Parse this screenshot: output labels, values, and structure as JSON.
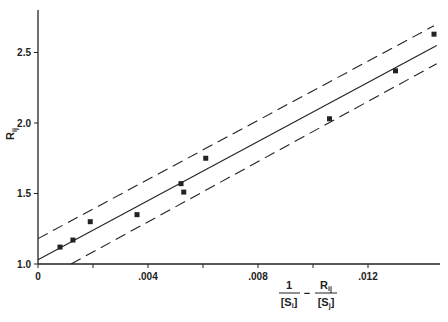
{
  "chart_data": {
    "type": "scatter",
    "title": "",
    "xlabel": "1/[S_i] - R_ij/[S_j]",
    "ylabel": "R_ij",
    "xlim": [
      0,
      0.0145
    ],
    "ylim": [
      1.0,
      2.8
    ],
    "grid": false,
    "legend": null,
    "x_ticks": [
      0,
      0.002,
      0.004,
      0.006,
      0.008,
      0.01,
      0.012
    ],
    "x_tick_labels": [
      "0",
      "",
      ".004",
      "",
      ".008",
      "",
      ".012"
    ],
    "y_ticks": [
      1.0,
      1.5,
      2.0,
      2.5
    ],
    "y_tick_labels": [
      "1.0",
      "1.5",
      "2.0",
      "2.5"
    ],
    "series": [
      {
        "name": "data points",
        "kind": "scatter",
        "marker": "square",
        "x": [
          0.0008,
          0.00127,
          0.0019,
          0.0036,
          0.0052,
          0.0053,
          0.0061,
          0.0106,
          0.013,
          0.0144
        ],
        "y": [
          1.12,
          1.17,
          1.3,
          1.35,
          1.57,
          1.51,
          1.75,
          2.03,
          2.37,
          2.63
        ]
      },
      {
        "name": "regression line",
        "kind": "line",
        "style": "solid",
        "x": [
          0,
          0.0145
        ],
        "y": [
          1.03,
          2.55
        ]
      },
      {
        "name": "upper confidence bound",
        "kind": "line",
        "style": "dashed",
        "x": [
          0,
          0.0144
        ],
        "y": [
          1.18,
          2.69
        ]
      },
      {
        "name": "lower confidence bound",
        "kind": "line",
        "style": "dashed",
        "x": [
          0.0012,
          0.0145
        ],
        "y": [
          1.0,
          2.42
        ]
      }
    ]
  },
  "labels": {
    "y_axis_main": "R",
    "y_axis_sub": "ij",
    "x_frac1_num": "1",
    "x_frac1_den_main": "[S",
    "x_frac1_den_sub": "i",
    "x_frac1_den_close": "]",
    "x_minus": "−",
    "x_frac2_num_main": "R",
    "x_frac2_num_sub": "ij",
    "x_frac2_den_main": "[S",
    "x_frac2_den_sub": "j",
    "x_frac2_den_close": "]"
  },
  "colors": {
    "ink": "#222222",
    "background": "#ffffff"
  }
}
